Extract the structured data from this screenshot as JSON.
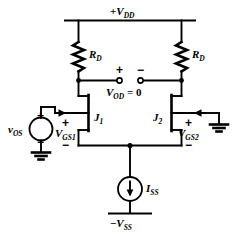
{
  "figure": {
    "name": "jfet-differential-amplifier",
    "background_color": "#ffffff",
    "line_color": "#000000",
    "width": 248,
    "height": 236
  },
  "rails": {
    "top": {
      "label_prefix": "+",
      "label_var": "V",
      "label_sub": "DD",
      "text": "+VDD"
    },
    "bottom": {
      "label_prefix": "−",
      "label_var": "V",
      "label_sub": "SS",
      "text": "−VSS"
    }
  },
  "components": {
    "resistor_left": {
      "var": "R",
      "sub": "D",
      "text": "RD"
    },
    "resistor_right": {
      "var": "R",
      "sub": "D",
      "text": "RD"
    },
    "transistor_left": {
      "var": "J",
      "sub": "1",
      "text": "J1"
    },
    "transistor_right": {
      "var": "J",
      "sub": "2",
      "text": "J2"
    },
    "current_source": {
      "var": "I",
      "sub": "SS",
      "text": "ISS",
      "arrow_direction": "down"
    },
    "offset_source": {
      "var": "v",
      "sub": "OS",
      "text": "vOS",
      "shape": "circle"
    }
  },
  "voltages": {
    "output": {
      "var": "V",
      "sub": "OD",
      "operator": "=",
      "value": "0",
      "text": "VOD = 0",
      "plus_sign": "+",
      "minus_sign": "−"
    },
    "gate_source_1": {
      "var": "V",
      "sub": "GS1",
      "text": "VGS1",
      "plus_sign": "+",
      "minus_sign": "−"
    },
    "gate_source_2": {
      "var": "V",
      "sub": "GS2",
      "text": "VGS2",
      "plus_sign": "+",
      "minus_sign": "−"
    },
    "offset_polarity": {
      "plus_sign": "+",
      "minus_sign": "−"
    }
  },
  "icons": {
    "ground_left": "ground-icon",
    "ground_right": "ground-icon",
    "terminal_positive": "open-terminal-icon",
    "terminal_negative": "open-terminal-icon"
  }
}
